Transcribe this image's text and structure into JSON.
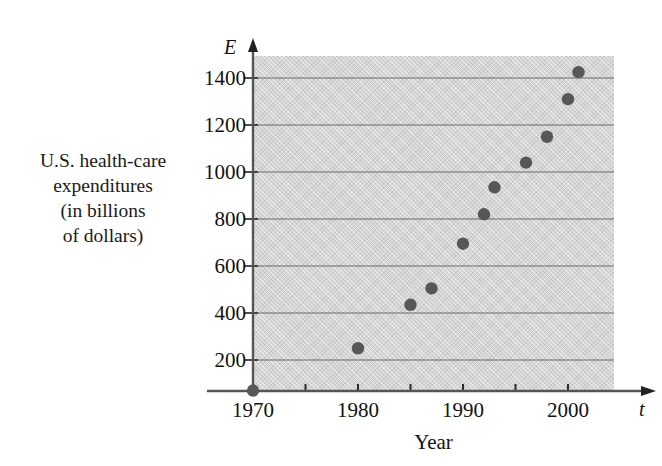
{
  "figure": {
    "background_color": "#ffffff",
    "plot_background_color": "#d5d5d5",
    "point_color": "#575757",
    "axis_color": "#555555",
    "gridline_color": "#6b6b6b"
  },
  "ylabel_lines": [
    "U.S. health-care",
    "expenditures",
    "(in billions",
    "of dollars)"
  ],
  "axis_names": {
    "y": "E",
    "x": "t"
  },
  "chart_data": {
    "type": "scatter",
    "title": "",
    "xlabel": "Year",
    "ylabel": "U.S. health-care expenditures (in billions of dollars)",
    "x_axis_symbol": "t",
    "y_axis_symbol": "E",
    "xlim": [
      1967,
      2001.5
    ],
    "ylim": [
      0,
      1500
    ],
    "xticks_major": [
      1970,
      1980,
      1990,
      2000
    ],
    "xticks_major_labels": [
      "1970",
      "1980",
      "1990",
      "2000"
    ],
    "xticks_minor": [
      1975,
      1985,
      1995
    ],
    "yticks": [
      200,
      400,
      600,
      800,
      1000,
      1200,
      1400
    ],
    "ytick_labels": [
      "200",
      "400",
      "600",
      "800",
      "1000",
      "1200",
      "1400"
    ],
    "grid": "horizontal",
    "legend": "none",
    "x": [
      1970,
      1980,
      1985,
      1987,
      1990,
      1992,
      1993,
      1996,
      1998,
      2000,
      2001
    ],
    "values": [
      70,
      250,
      435,
      505,
      695,
      820,
      935,
      1040,
      1150,
      1310,
      1425
    ],
    "points": [
      {
        "year": 1970,
        "expenditure": 70
      },
      {
        "year": 1980,
        "expenditure": 250
      },
      {
        "year": 1985,
        "expenditure": 435
      },
      {
        "year": 1987,
        "expenditure": 505
      },
      {
        "year": 1990,
        "expenditure": 695
      },
      {
        "year": 1992,
        "expenditure": 820
      },
      {
        "year": 1993,
        "expenditure": 935
      },
      {
        "year": 1996,
        "expenditure": 1040
      },
      {
        "year": 1998,
        "expenditure": 1150
      },
      {
        "year": 2000,
        "expenditure": 1310
      },
      {
        "year": 2001,
        "expenditure": 1425
      }
    ]
  }
}
